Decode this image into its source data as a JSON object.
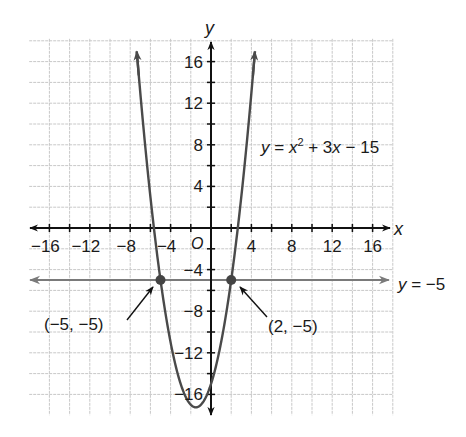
{
  "chart_data": {
    "type": "line",
    "title": "",
    "xlabel": "x",
    "ylabel": "y",
    "origin_label": "O",
    "xlim": [
      -18,
      18
    ],
    "ylim": [
      -18,
      18
    ],
    "grid": true,
    "grid_step": 2,
    "x_ticks": [
      -16,
      -12,
      -8,
      -4,
      4,
      8,
      12,
      16
    ],
    "y_ticks": [
      16,
      12,
      8,
      4,
      -4,
      -8,
      -12,
      -16
    ],
    "x_tick_labels": [
      "−16",
      "−12",
      "−8",
      "−4",
      "4",
      "8",
      "12",
      "16"
    ],
    "y_tick_labels": [
      "16",
      "12",
      "8",
      "4",
      "−4",
      "−8",
      "−12",
      "−16"
    ],
    "series": [
      {
        "name": "y = x² + 3x − 15",
        "kind": "parabola",
        "equation": {
          "a": 1,
          "b": 3,
          "c": -15
        },
        "x_range": [
          -7.35,
          4.35
        ],
        "vertex": [
          -1.5,
          -17.25
        ],
        "color": "#4a4a4a"
      },
      {
        "name": "y = −5",
        "kind": "horizontal_line",
        "y": -5,
        "x_range": [
          -18,
          18
        ],
        "color": "#7a7a7a"
      }
    ],
    "points": [
      {
        "x": -5,
        "y": -5,
        "label": "(−5, −5)"
      },
      {
        "x": 2,
        "y": -5,
        "label": "(2, −5)"
      }
    ],
    "annotations": {
      "parabola_label": {
        "prefix": "y = x",
        "sup": "2",
        "suffix": " + 3x − 15"
      },
      "line_label": "y = −5"
    },
    "colors": {
      "axis": "#111111",
      "grid": "#c8c8c8",
      "curve": "#4a4a4a",
      "hline": "#7a7a7a",
      "point": "#444444"
    }
  }
}
